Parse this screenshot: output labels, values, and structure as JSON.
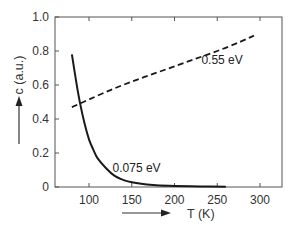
{
  "chart_data": {
    "type": "line",
    "title": "",
    "xlabel": "T (K)",
    "ylabel": "c (a.u.)",
    "xlim": [
      60,
      326
    ],
    "ylim": [
      0,
      1.0
    ],
    "x_ticks": [
      100,
      150,
      200,
      250,
      300
    ],
    "x_tick_labels": [
      "100",
      "150",
      "200",
      "250",
      "300"
    ],
    "y_ticks": [
      0,
      0.2,
      0.4,
      0.6,
      0.8,
      1.0
    ],
    "y_tick_labels": [
      "0",
      "0.2",
      "0.4",
      "0.6",
      "0.8",
      "1.0"
    ],
    "grid": false,
    "legend": "inline labels",
    "series": [
      {
        "name": "0.075 eV",
        "style": "solid",
        "color": "#1a1a1a",
        "x": [
          80,
          85,
          90,
          95,
          100,
          105,
          110,
          120,
          130,
          140,
          150,
          175,
          200,
          230,
          260
        ],
        "y": [
          0.78,
          0.62,
          0.48,
          0.37,
          0.28,
          0.22,
          0.17,
          0.11,
          0.065,
          0.042,
          0.028,
          0.012,
          0.006,
          0.003,
          0.002
        ]
      },
      {
        "name": "0.55 eV",
        "style": "dashed",
        "color": "#1a1a1a",
        "x": [
          80,
          100,
          125,
          150,
          175,
          200,
          225,
          250,
          275,
          293
        ],
        "y": [
          0.47,
          0.515,
          0.57,
          0.62,
          0.665,
          0.71,
          0.755,
          0.8,
          0.85,
          0.89
        ]
      }
    ],
    "annotations": [
      {
        "text": "0.55 eV",
        "x": 265,
        "y": 0.75
      },
      {
        "text": "0.075 eV",
        "x": 165,
        "y": 0.11
      }
    ],
    "axis_arrows": {
      "x": "right-pointing arrow left of x label",
      "y": "up-pointing arrow below y label"
    }
  }
}
